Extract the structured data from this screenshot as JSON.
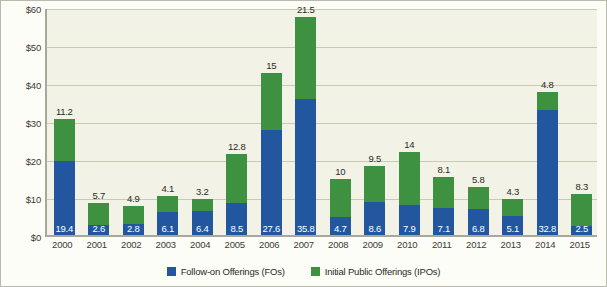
{
  "chart_data": {
    "type": "bar",
    "stacked": true,
    "title": "",
    "xlabel": "",
    "ylabel": "",
    "ylim": [
      0,
      60
    ],
    "ytick_values": [
      0,
      10,
      20,
      30,
      40,
      50,
      60
    ],
    "ytick_labels": [
      "$0",
      "$10",
      "$20",
      "$30",
      "$40",
      "$50",
      "$60"
    ],
    "grid": true,
    "legend_position": "bottom",
    "categories": [
      "2000",
      "2001",
      "2002",
      "2003",
      "2004",
      "2005",
      "2006",
      "2007",
      "2008",
      "2009",
      "2010",
      "2011",
      "2012",
      "2013",
      "2014",
      "2015"
    ],
    "series": [
      {
        "name": "Follow-on Offerings (FOs)",
        "color": "#22579f",
        "values": [
          19.4,
          2.6,
          2.8,
          6.1,
          6.4,
          8.5,
          27.6,
          35.8,
          4.7,
          8.6,
          7.9,
          7.1,
          6.8,
          5.1,
          32.8,
          2.5
        ]
      },
      {
        "name": "Initial Public Offerings (IPOs)",
        "color": "#3d9140",
        "values": [
          11.2,
          5.7,
          4.9,
          4.1,
          3.2,
          12.8,
          15,
          21.5,
          10,
          9.5,
          14,
          8.1,
          5.8,
          4.3,
          4.8,
          8.3
        ]
      }
    ],
    "fo_labels": [
      "19.4",
      "2.6",
      "2.8",
      "6.1",
      "6.4",
      "8.5",
      "27.6",
      "35.8",
      "4.7",
      "8.6",
      "7.9",
      "7.1",
      "6.8",
      "5.1",
      "32.8",
      "2.5"
    ],
    "ipo_labels": [
      "11.2",
      "5.7",
      "4.9",
      "4.1",
      "3.2",
      "12.8",
      "15",
      "21.5",
      "10",
      "9.5",
      "14",
      "8.1",
      "5.8",
      "4.3",
      "4.8",
      "8.3"
    ]
  },
  "legend": {
    "items": [
      {
        "label": "Follow-on Offerings (FOs)",
        "color": "#22579f"
      },
      {
        "label": "Initial Public Offerings (IPOs)",
        "color": "#3d9140"
      }
    ]
  }
}
